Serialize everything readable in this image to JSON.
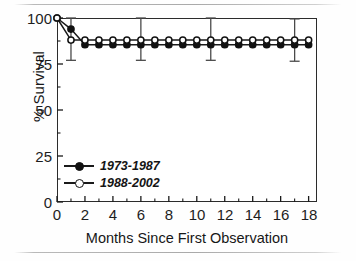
{
  "figure": {
    "kind": "scanned-figure",
    "background_color": "#fefefe",
    "ink_color": "#1a1a1a"
  },
  "axes": {
    "y": {
      "title": "% Survival",
      "ticks": [
        "0",
        "25",
        "50",
        "75",
        "100"
      ]
    },
    "x": {
      "title": "Months Since First Observation",
      "ticks": [
        "0",
        "2",
        "4",
        "6",
        "8",
        "10",
        "12",
        "14",
        "16",
        "18"
      ]
    }
  },
  "legend": {
    "entries": [
      {
        "label": "1973-1987",
        "marker": "filled-circle-icon"
      },
      {
        "label": "1988-2002",
        "marker": "open-circle-icon"
      }
    ]
  },
  "chart_data": {
    "type": "line",
    "title": "",
    "subtitle": "",
    "xlabel": "Months Since First Observation",
    "ylabel": "% Survival",
    "xlim": [
      0,
      18.6
    ],
    "ylim": [
      0,
      100
    ],
    "xticks": [
      0,
      2,
      4,
      6,
      8,
      10,
      12,
      14,
      16,
      18
    ],
    "xminorticks": [
      1,
      3,
      5,
      7,
      9,
      11,
      13,
      15,
      17
    ],
    "yticks": [
      0,
      25,
      50,
      75,
      100
    ],
    "grid": false,
    "legend_position": "inside lower-left",
    "x": [
      0,
      1,
      2,
      3,
      4,
      5,
      6,
      7,
      8,
      9,
      10,
      11,
      12,
      13,
      14,
      15,
      16,
      17,
      18
    ],
    "series": [
      {
        "name": "1973-1987",
        "marker": "filled-circle",
        "values": [
          100,
          94,
          85.5,
          85.5,
          85.5,
          85.5,
          85.5,
          85.5,
          85.5,
          85.5,
          85.5,
          85.5,
          85.5,
          85.5,
          85.5,
          85.5,
          85.5,
          85.5,
          85.5
        ]
      },
      {
        "name": "1988-2002",
        "marker": "open-circle",
        "values": [
          100,
          88,
          88,
          88,
          88,
          88,
          88,
          88,
          88,
          88,
          88,
          88,
          88,
          88,
          88,
          88,
          88,
          88,
          88
        ]
      }
    ],
    "errorbars": {
      "series": "1988-2002",
      "points": [
        {
          "x": 1,
          "y": 88,
          "low": 77,
          "high": 100
        },
        {
          "x": 6,
          "y": 88,
          "low": 77,
          "high": 100
        },
        {
          "x": 11,
          "y": 88,
          "low": 77,
          "high": 100
        },
        {
          "x": 17,
          "y": 88,
          "low": 76.5,
          "high": 99.5
        }
      ]
    }
  }
}
